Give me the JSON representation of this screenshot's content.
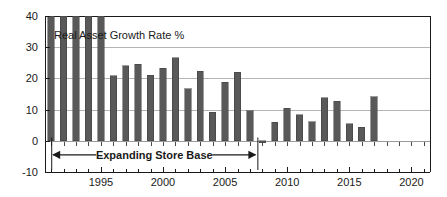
{
  "chart_data": {
    "type": "bar",
    "title": "",
    "series_label": "Real Asset Growth Rate %",
    "xlabel": "",
    "ylabel": "",
    "ylim": [
      -10,
      40
    ],
    "xlim": [
      1990.5,
      2021.5
    ],
    "ytick_labels": [
      "40",
      "30",
      "20",
      "10",
      "0",
      "-10"
    ],
    "yticks": [
      40,
      30,
      20,
      10,
      0,
      -10
    ],
    "xtick_labels": [
      "1995",
      "2000",
      "2005",
      "2010",
      "2015",
      "2020"
    ],
    "xticks": [
      1995,
      2000,
      2005,
      2010,
      2015,
      2020
    ],
    "grid": "horizontal",
    "legend": "none",
    "bar_color": "#595959",
    "categories": [
      1991,
      1992,
      1993,
      1994,
      1995,
      1996,
      1997,
      1998,
      1999,
      2000,
      2001,
      2002,
      2003,
      2004,
      2005,
      2006,
      2007,
      2008,
      2009,
      2010,
      2011,
      2012,
      2013,
      2014,
      2015,
      2016,
      2017,
      2018,
      2019,
      2020,
      2021
    ],
    "values": [
      44.0,
      44.0,
      44.0,
      44.0,
      44.0,
      20.8,
      24.0,
      24.6,
      21.0,
      23.3,
      26.6,
      16.7,
      22.3,
      9.2,
      18.8,
      22.0,
      9.6,
      -0.7,
      6.0,
      10.5,
      8.3,
      6.1,
      13.8,
      12.6,
      5.5,
      4.4,
      14.1,
      null,
      null,
      null,
      null
    ],
    "clipped_note": "40",
    "annotations": [
      {
        "text": "Expanding Store Base",
        "type": "double-arrow-span",
        "x_start": 1991,
        "x_end": 2007.6,
        "y": -4.5
      }
    ]
  },
  "axes": {
    "frame_color": "#1a1a1a",
    "grid_color": "#b5b5b5"
  }
}
